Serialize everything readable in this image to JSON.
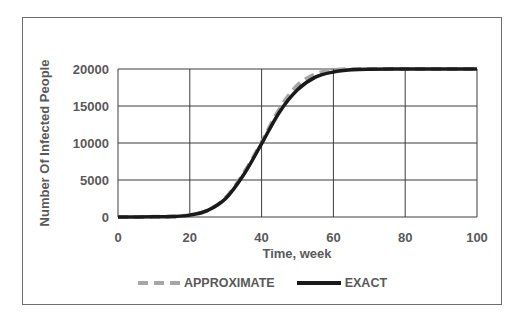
{
  "chart_data": {
    "type": "line",
    "title": "",
    "xlabel": "Time, week",
    "ylabel": "Number Of Infected People",
    "xlim": [
      0,
      100
    ],
    "ylim": [
      0,
      20000
    ],
    "xticks": [
      "0",
      "20",
      "40",
      "60",
      "80",
      "100"
    ],
    "yticks": [
      "0",
      "5000",
      "10000",
      "15000",
      "20000"
    ],
    "grid": true,
    "legend_position": "bottom",
    "x": [
      0,
      10,
      15,
      20,
      25,
      30,
      35,
      40,
      45,
      50,
      55,
      60,
      65,
      70,
      80,
      90,
      100
    ],
    "series": [
      {
        "name": "APPROXIMATE",
        "style": "dashed",
        "color": "#a6a6a6",
        "values": [
          0,
          20,
          60,
          250,
          900,
          2600,
          5900,
          10100,
          14600,
          17800,
          19300,
          19850,
          19980,
          20000,
          20000,
          20000,
          20000
        ]
      },
      {
        "name": "EXACT",
        "style": "solid",
        "color": "#1a1a1a",
        "values": [
          0,
          20,
          60,
          250,
          900,
          2500,
          5700,
          9900,
          14200,
          17200,
          18900,
          19600,
          19900,
          19980,
          20000,
          20000,
          20000
        ]
      }
    ]
  },
  "legend": {
    "approx_label": "APPROXIMATE",
    "exact_label": "EXACT"
  },
  "axes": {
    "xlabel": "Time, week",
    "ylabel": "Number Of Infected People"
  }
}
